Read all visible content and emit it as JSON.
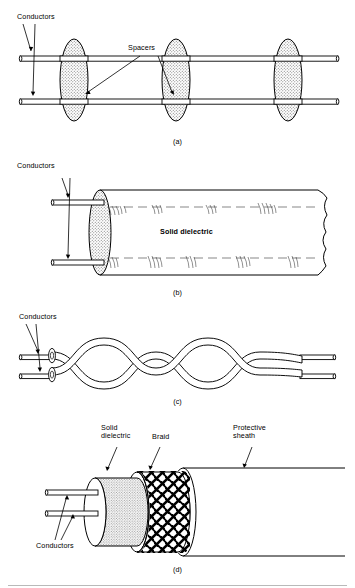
{
  "figure": {
    "type": "transmission-line-types",
    "background": "#ffffff",
    "ink": "#000000",
    "fill_shade": "#e8e8e8"
  },
  "panels": [
    {
      "id": "a",
      "caption": "(a)",
      "name": "two-wire-open-line",
      "labels": [
        {
          "text": "Conductors",
          "name": "conductors-label"
        },
        {
          "text": "Spacers",
          "name": "spacers-label"
        }
      ],
      "parts": {
        "conductor_count": 2,
        "spacer_count": 3
      }
    },
    {
      "id": "b",
      "caption": "(b)",
      "name": "twin-lead-solid-dielectric-line",
      "labels": [
        {
          "text": "Conductors",
          "name": "conductors-label"
        },
        {
          "text": "Solid dielectric",
          "name": "solid-dielectric-label"
        }
      ],
      "parts": {
        "conductor_count": 2
      }
    },
    {
      "id": "c",
      "caption": "(c)",
      "name": "twisted-pair-line",
      "labels": [
        {
          "text": "Conductors",
          "name": "conductors-label"
        }
      ],
      "parts": {
        "conductor_count": 2,
        "twist_count": 5
      }
    },
    {
      "id": "d",
      "caption": "(d)",
      "name": "coaxial-cable",
      "labels": [
        {
          "text": "Solid\ndielectric",
          "name": "solid-dielectric-label"
        },
        {
          "text": "Braid",
          "name": "braid-label"
        },
        {
          "text": "Protective\nsheath",
          "name": "protective-sheath-label"
        },
        {
          "text": "Conductors",
          "name": "conductors-label"
        }
      ],
      "parts": {
        "conductor_count": 2
      }
    }
  ]
}
